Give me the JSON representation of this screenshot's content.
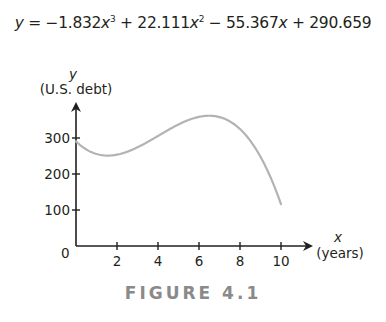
{
  "equation": {
    "lhs": "y",
    "eq": " = −1.832",
    "t1_var": "x",
    "t1_exp": "3",
    "t2": " + 22.111",
    "t2_var": "x",
    "t2_exp": "2",
    "t3": " − 55.367",
    "t3_var": "x",
    "t4": " + 290.659"
  },
  "axes": {
    "y_var": "y",
    "y_label": "(U.S. debt)",
    "x_var": "x",
    "x_label": "(years)",
    "origin": "0"
  },
  "caption": "FIGURE 4.1",
  "colors": {
    "curve": "#b3b3b3",
    "axis": "#231f20",
    "caption": "#8a8a8a"
  },
  "chart_data": {
    "type": "line",
    "caption": "FIGURE 4.1",
    "xlabel": "x (years)",
    "ylabel": "y (U.S. debt)",
    "xticks": [
      2,
      4,
      6,
      8,
      10
    ],
    "yticks": [
      100,
      200,
      300
    ],
    "xlim": [
      0,
      11.4
    ],
    "ylim": [
      0,
      395
    ],
    "grid": false,
    "legend": null,
    "coefficients": {
      "a3": -1.832,
      "a2": 22.111,
      "a1": -55.367,
      "a0": 290.659
    },
    "series": [
      {
        "name": "U.S. debt model",
        "x": [
          0,
          1,
          2,
          3,
          4,
          5,
          6,
          7,
          8,
          9,
          10
        ],
        "y": [
          290.7,
          255.6,
          243.7,
          244.1,
          245.9,
          238.2,
          210.0,
          150.4,
          48.5,
          -106.7,
          116.1
        ]
      }
    ]
  }
}
